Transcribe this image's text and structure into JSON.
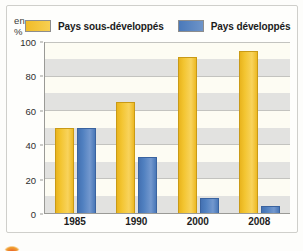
{
  "chart_data": {
    "type": "bar",
    "title": "",
    "xlabel": "",
    "ylabel": "en %",
    "categories": [
      "1985",
      "1990",
      "2000",
      "2008"
    ],
    "series": [
      {
        "name": "Pays sous-développés",
        "color": "#F2C230",
        "values": [
          50,
          65,
          91,
          95
        ]
      },
      {
        "name": "Pays développés",
        "color": "#4D7EBF",
        "values": [
          50,
          33,
          9,
          4
        ]
      }
    ],
    "ylim": [
      0,
      100
    ],
    "yticks": [
      0,
      20,
      40,
      60,
      80,
      100
    ],
    "grid": true,
    "banding_step": 10,
    "legend_position": "top"
  },
  "legend": {
    "unit_label": "en %",
    "entries": [
      {
        "label": "Pays sous-développés",
        "swatch": "yellow-swatch-icon"
      },
      {
        "label": "Pays développés",
        "swatch": "blue-swatch-icon"
      }
    ]
  }
}
